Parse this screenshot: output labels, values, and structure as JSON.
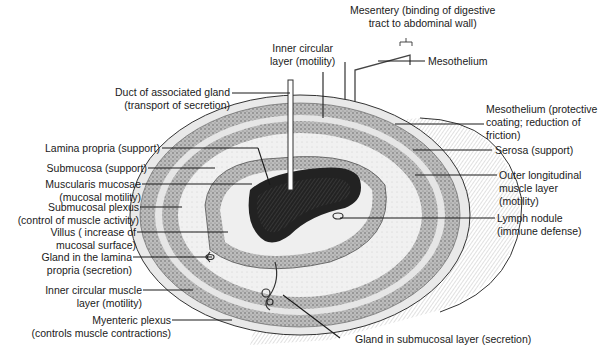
{
  "diagram": {
    "labels": {
      "mesentery": "Mesentery (binding of digestive\ntract to abdominal wall)",
      "mesothelium_top": "Mesothelium",
      "inner_circular_top": "Inner circular\nlayer (motility)",
      "duct": "Duct of associated gland\n(transport of secretion)",
      "mesothelium_protective": "Mesothelium (protective\ncoating; reduction of\nfriction)",
      "serosa": "Serosa (support)",
      "outer_longitudinal": "Outer longitudinal\nmuscle layer\n(motility)",
      "lymph_nodule": "Lymph nodule\n(immune defense)",
      "lamina_propria": "Lamina propria (support)",
      "submucosa": "Submucosa (support)",
      "muscularis_mucosae": "Muscularis mucosae\n(mucosal motility)",
      "submucosal_plexus": "Submucosal plexus\n(control of muscle activity)",
      "villus": "Villus ( increase of\nmucosal surface)",
      "gland_lamina": "Gland in the lamina\npropria (secretion)",
      "inner_circular_left": "Inner circular muscle\nlayer (motility)",
      "myenteric": "Myenteric plexus\n(controls muscle contractions)",
      "gland_submucosal": "Gland in submucosal layer (secretion)"
    },
    "colors": {
      "line": "#1a1a1a",
      "shade": "#8a8a8a",
      "light": "#d9d9d9",
      "lumen": "#222222"
    }
  }
}
